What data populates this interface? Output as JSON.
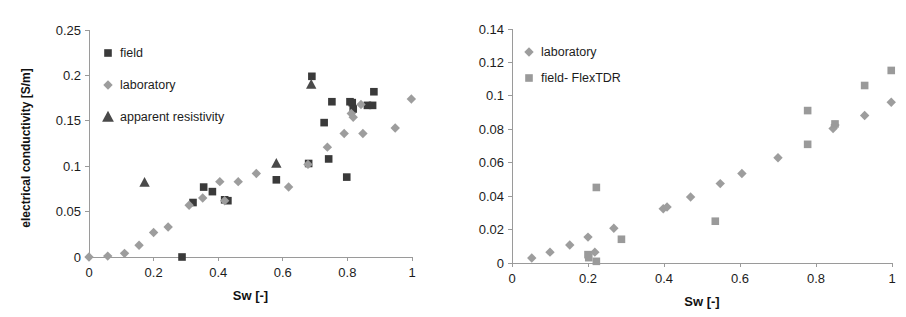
{
  "figure": {
    "panel_count": 2,
    "background_color": "#ffffff"
  },
  "colors": {
    "field_marker": "#3a3a3a",
    "laboratory_marker": "#9d9d9d",
    "apparent_resistivity_marker": "#4a4a4a",
    "field_flextdr_marker": "#9a9a9a",
    "axis": "#9a9a9a",
    "text": "#1c1c1c"
  },
  "chart_data": [
    {
      "panel": "left",
      "type": "scatter",
      "title": "",
      "xlabel": "Sw [-]",
      "ylabel": "electrical conductivity [S/m]",
      "xlim": [
        0,
        1
      ],
      "ylim": [
        0,
        0.25
      ],
      "xticks": [
        "0",
        "0.2",
        "0.4",
        "0.6",
        "0.8",
        "1"
      ],
      "xtick_values": [
        0,
        0.2,
        0.4,
        0.6,
        0.8,
        1
      ],
      "yticks": [
        "0",
        "0.05",
        "0.1",
        "0.15",
        "0.2",
        "0.25"
      ],
      "ytick_values": [
        0,
        0.05,
        0.1,
        0.15,
        0.2,
        0.25
      ],
      "grid": false,
      "legend_position": "upper-left",
      "series": [
        {
          "name": "field",
          "marker": "square",
          "color": "#3a3a3a",
          "points": [
            [
              0.288,
              0.0
            ],
            [
              0.322,
              0.06
            ],
            [
              0.355,
              0.077
            ],
            [
              0.382,
              0.072
            ],
            [
              0.42,
              0.063
            ],
            [
              0.43,
              0.062
            ],
            [
              0.58,
              0.085
            ],
            [
              0.68,
              0.103
            ],
            [
              0.69,
              0.199
            ],
            [
              0.728,
              0.148
            ],
            [
              0.742,
              0.108
            ],
            [
              0.752,
              0.171
            ],
            [
              0.798,
              0.088
            ],
            [
              0.808,
              0.171
            ],
            [
              0.815,
              0.17
            ],
            [
              0.818,
              0.163
            ],
            [
              0.862,
              0.167
            ],
            [
              0.878,
              0.167
            ],
            [
              0.882,
              0.182
            ]
          ]
        },
        {
          "name": "laboratory",
          "marker": "diamond",
          "color": "#9d9d9d",
          "points": [
            [
              0.0,
              0.0
            ],
            [
              0.058,
              0.001
            ],
            [
              0.11,
              0.004
            ],
            [
              0.155,
              0.013
            ],
            [
              0.2,
              0.027
            ],
            [
              0.245,
              0.033
            ],
            [
              0.31,
              0.057
            ],
            [
              0.352,
              0.065
            ],
            [
              0.405,
              0.083
            ],
            [
              0.42,
              0.062
            ],
            [
              0.462,
              0.083
            ],
            [
              0.518,
              0.092
            ],
            [
              0.618,
              0.077
            ],
            [
              0.678,
              0.102
            ],
            [
              0.738,
              0.121
            ],
            [
              0.79,
              0.136
            ],
            [
              0.812,
              0.158
            ],
            [
              0.818,
              0.154
            ],
            [
              0.842,
              0.168
            ],
            [
              0.848,
              0.136
            ],
            [
              0.948,
              0.142
            ],
            [
              0.998,
              0.174
            ]
          ]
        },
        {
          "name": "apparent resistivity",
          "marker": "triangle",
          "color": "#4a4a4a",
          "points": [
            [
              0.172,
              0.082
            ],
            [
              0.58,
              0.103
            ],
            [
              0.688,
              0.19
            ]
          ]
        }
      ]
    },
    {
      "panel": "right",
      "type": "scatter",
      "title": "",
      "xlabel": "Sw [-]",
      "ylabel": "",
      "xlim": [
        0,
        1
      ],
      "ylim": [
        0,
        0.14
      ],
      "xticks": [
        "0",
        "0.2",
        "0.4",
        "0.6",
        "0.8",
        "1"
      ],
      "xtick_values": [
        0,
        0.2,
        0.4,
        0.6,
        0.8,
        1
      ],
      "yticks": [
        "0",
        "0.02",
        "0.04",
        "0.06",
        "0.08",
        "0.1",
        "0.12",
        "0.14"
      ],
      "ytick_values": [
        0,
        0.02,
        0.04,
        0.06,
        0.08,
        0.1,
        0.12,
        0.14
      ],
      "grid": false,
      "legend_position": "upper-left",
      "series": [
        {
          "name": "laboratory",
          "marker": "diamond",
          "color": "#9d9d9d",
          "points": [
            [
              0.052,
              0.003
            ],
            [
              0.1,
              0.0065
            ],
            [
              0.152,
              0.0108
            ],
            [
              0.2,
              0.0155
            ],
            [
              0.218,
              0.0065
            ],
            [
              0.268,
              0.0208
            ],
            [
              0.398,
              0.0325
            ],
            [
              0.408,
              0.0335
            ],
            [
              0.47,
              0.0395
            ],
            [
              0.548,
              0.0475
            ],
            [
              0.605,
              0.0535
            ],
            [
              0.7,
              0.063
            ],
            [
              0.845,
              0.0805
            ],
            [
              0.85,
              0.0825
            ],
            [
              0.928,
              0.0882
            ],
            [
              0.998,
              0.0962
            ]
          ]
        },
        {
          "name": "field- FlexTDR",
          "marker": "square",
          "color": "#9a9a9a",
          "points": [
            [
              0.2,
              0.005
            ],
            [
              0.202,
              0.0032
            ],
            [
              0.222,
              0.001
            ],
            [
              0.222,
              0.0452
            ],
            [
              0.288,
              0.0142
            ],
            [
              0.535,
              0.025
            ],
            [
              0.778,
              0.071
            ],
            [
              0.778,
              0.0912
            ],
            [
              0.85,
              0.0832
            ],
            [
              0.928,
              0.1062
            ],
            [
              0.998,
              0.1152
            ]
          ]
        }
      ]
    }
  ],
  "legends": {
    "left": [
      {
        "label": "field",
        "marker": "square",
        "color": "#3a3a3a"
      },
      {
        "label": "laboratory",
        "marker": "diamond",
        "color": "#9d9d9d"
      },
      {
        "label": "apparent resistivity",
        "marker": "triangle",
        "color": "#4a4a4a"
      }
    ],
    "right": [
      {
        "label": "laboratory",
        "marker": "diamond",
        "color": "#9d9d9d"
      },
      {
        "label": "field- FlexTDR",
        "marker": "square",
        "color": "#9a9a9a"
      }
    ]
  }
}
